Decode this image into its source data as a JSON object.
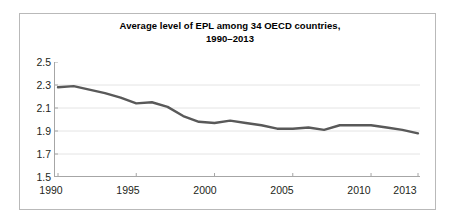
{
  "figure": {
    "background_color": "#ffffff",
    "frame_color": "#b9b9b9"
  },
  "chart_data": {
    "type": "line",
    "title": "Average level of EPL among 34 OECD countries,",
    "title_line2": "1990–2013",
    "subtitle": "",
    "xlabel": "",
    "ylabel": "",
    "xlim": [
      1990,
      2013
    ],
    "ylim": [
      1.5,
      2.5
    ],
    "grid": true,
    "legend": "none",
    "line_color": "#595959",
    "line_width": 2.4,
    "y_ticks": [
      "2.5",
      "2.3",
      "2.1",
      "1.9",
      "1.7",
      "1.5"
    ],
    "y_tick_values": [
      2.5,
      2.3,
      2.1,
      1.9,
      1.7,
      1.5
    ],
    "x_ticks": [
      "1990",
      "1995",
      "2000",
      "2005",
      "2010",
      "2013"
    ],
    "x_tick_values": [
      1990,
      1995,
      2000,
      2005,
      2010,
      2013
    ],
    "x": [
      1990,
      1991,
      1992,
      1993,
      1994,
      1995,
      1996,
      1997,
      1998,
      1999,
      2000,
      2001,
      2002,
      2003,
      2004,
      2005,
      2006,
      2007,
      2008,
      2009,
      2010,
      2011,
      2012,
      2013
    ],
    "series": [
      {
        "name": "Average EPL",
        "values": [
          2.28,
          2.29,
          2.26,
          2.23,
          2.19,
          2.14,
          2.15,
          2.11,
          2.03,
          1.98,
          1.97,
          1.99,
          1.97,
          1.95,
          1.92,
          1.92,
          1.93,
          1.91,
          1.95,
          1.95,
          1.95,
          1.93,
          1.91,
          1.88
        ]
      }
    ]
  }
}
